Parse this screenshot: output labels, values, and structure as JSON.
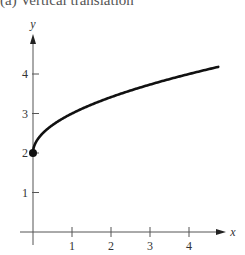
{
  "caption": "(a)  Vertical translation",
  "chart_data": {
    "type": "line",
    "title": "(a) Vertical translation",
    "xlabel": "x",
    "ylabel": "y",
    "xlim": [
      0,
      4.75
    ],
    "ylim": [
      0,
      4.5
    ],
    "x_ticks": [
      1,
      2,
      3,
      4
    ],
    "y_ticks": [
      1,
      2,
      3,
      4
    ],
    "grid": false,
    "legend": null,
    "series": [
      {
        "name": "y = sqrt(x) + 2",
        "x": [
          0,
          0.25,
          0.5,
          1,
          1.5,
          2,
          2.5,
          3,
          3.5,
          4,
          4.5,
          4.75
        ],
        "values": [
          2,
          2.5,
          2.71,
          3,
          3.22,
          3.41,
          3.58,
          3.73,
          3.87,
          4,
          4.12,
          4.18
        ]
      }
    ],
    "annotations": [
      {
        "type": "point",
        "x": 0,
        "y": 2,
        "style": "filled-dot"
      }
    ]
  },
  "axis": {
    "x_label": "x",
    "y_label": "y",
    "x_tick_labels": [
      "1",
      "2",
      "3",
      "4"
    ],
    "y_tick_labels": [
      "1",
      "2",
      "3",
      "4"
    ]
  }
}
